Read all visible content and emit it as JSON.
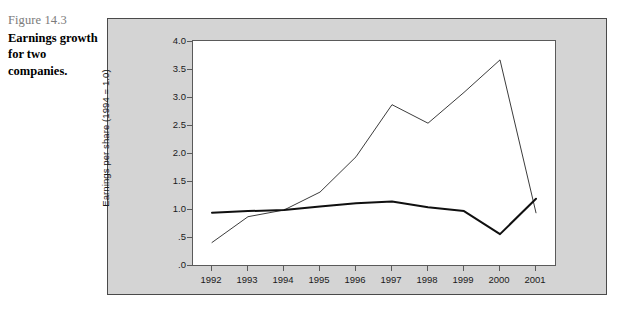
{
  "caption": {
    "figure_number": "Figure 14.3",
    "title": "Earnings growth for two companies."
  },
  "chart_data": {
    "type": "line",
    "title": "",
    "xlabel": "",
    "ylabel": "Earnings per share (1994 = 1.0)",
    "x": [
      1992,
      1993,
      1994,
      1995,
      1996,
      1997,
      1998,
      1999,
      2000,
      2001
    ],
    "categories": [
      "1992",
      "1993",
      "1994",
      "1995",
      "1996",
      "1997",
      "1998",
      "1999",
      "2000",
      "2001"
    ],
    "ytick_labels": [
      "4.0",
      "3.5",
      "3.0",
      "2.5",
      "2.0",
      "1.5",
      "1.0",
      ".5",
      ".0"
    ],
    "ytick_values": [
      4.0,
      3.5,
      3.0,
      2.5,
      2.0,
      1.5,
      1.0,
      0.5,
      0.0
    ],
    "ylim": [
      0.0,
      4.0
    ],
    "xlim": [
      1992,
      2001
    ],
    "grid": false,
    "legend": "inline-annotations",
    "series": [
      {
        "name": "Intel",
        "color": "#3c3c3c",
        "line_width": 1.0,
        "values": [
          0.42,
          0.88,
          1.0,
          1.32,
          1.95,
          2.88,
          2.55,
          3.1,
          3.68,
          0.95
        ]
      },
      {
        "name": "AEP",
        "color": "#101010",
        "line_width": 2.0,
        "values": [
          0.95,
          0.98,
          1.0,
          1.06,
          1.12,
          1.15,
          1.05,
          0.98,
          0.57,
          1.2
        ]
      }
    ],
    "annotations": [
      {
        "text": "Intel",
        "x": 2000.6,
        "y": 3.2
      },
      {
        "text": "AEP",
        "x": 1997.5,
        "y": 1.35
      }
    ]
  }
}
